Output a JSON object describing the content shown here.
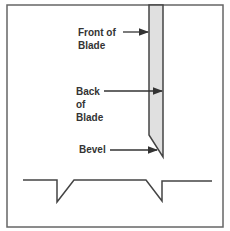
{
  "diagram": {
    "labels": {
      "front_of_blade": [
        "Front of",
        "Blade"
      ],
      "back_of_blade": [
        "Back",
        "of",
        "Blade"
      ],
      "bevel": "Bevel"
    },
    "colors": {
      "frame": "#555555",
      "blade_fill": "#e0e0e0",
      "line": "#444444",
      "text": "#333333"
    }
  }
}
